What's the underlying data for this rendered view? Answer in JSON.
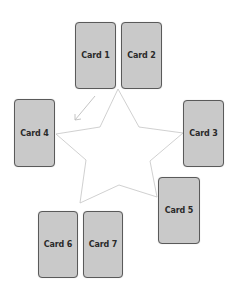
{
  "diagram": {
    "colors": {
      "card_fill": "#c9c9c9",
      "card_border": "#5a5a5a",
      "star_stroke": "#c4c4c4",
      "arrow_stroke": "#bdbdbd",
      "background": "#ffffff"
    },
    "cards": [
      {
        "id": "card-1",
        "label": "Card 1"
      },
      {
        "id": "card-2",
        "label": "Card 2"
      },
      {
        "id": "card-3",
        "label": "Card 3"
      },
      {
        "id": "card-4",
        "label": "Card 4"
      },
      {
        "id": "card-5",
        "label": "Card 5"
      },
      {
        "id": "card-6",
        "label": "Card 6"
      },
      {
        "id": "card-7",
        "label": "Card 7"
      }
    ],
    "star": {
      "shape": "five-pointed star outline connecting the card positions"
    },
    "arrow": {
      "direction": "down-left, from near Card 1 toward Card 4"
    }
  }
}
